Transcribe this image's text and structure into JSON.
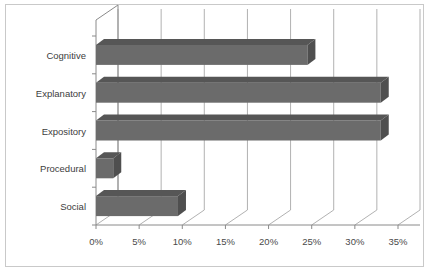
{
  "chart_data": {
    "type": "bar",
    "orientation": "horizontal",
    "style": "3d",
    "title": "",
    "xlabel": "",
    "ylabel": "",
    "categories": [
      "Cognitive",
      "Explanatory",
      "Expository",
      "Procedural",
      "Social"
    ],
    "values": [
      24.5,
      33.0,
      33.0,
      2.0,
      9.5
    ],
    "value_labels": [
      "",
      "",
      "",
      "",
      ""
    ],
    "xlim": [
      0,
      35
    ],
    "xtick_labels": [
      "0%",
      "5%",
      "10%",
      "15%",
      "20%",
      "25%",
      "30%",
      "35%"
    ],
    "xtick_values": [
      0,
      5,
      10,
      15,
      20,
      25,
      30,
      35
    ],
    "grid": true,
    "grid_axis": "x",
    "legend": null,
    "legend_position": "none",
    "series": [
      {
        "name": "",
        "values": [
          24.5,
          33.0,
          33.0,
          2.0,
          9.5
        ],
        "color": "#6b6b6b"
      }
    ]
  },
  "colors": {
    "bar_face": "#6b6b6b",
    "bar_top": "#565656",
    "bar_side": "#4f4f4f",
    "plot_background": "#ffffff",
    "grid_line": "#a8a8a8",
    "axis_line": "#8a8a8a",
    "outer_border": "#c9c9c9",
    "tick_text": "#4a4a4a",
    "category_text": "#3d3d3d"
  }
}
